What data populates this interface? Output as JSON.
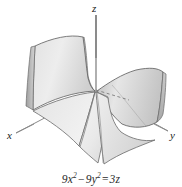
{
  "figure": {
    "caption": {
      "full_text": "9x² − 9y² = 3z",
      "term1_coeff": "9",
      "term1_var": "x",
      "term1_exp": "2",
      "operator_minus": "−",
      "term2_coeff": "9",
      "term2_var": "y",
      "term2_exp": "2",
      "operator_equals": "=",
      "rhs_coeff": "3",
      "rhs_var": "z"
    },
    "axes": {
      "x_label": "x",
      "y_label": "y",
      "z_label": "z"
    },
    "surface": {
      "name": "hyperbolic-paraboloid",
      "fill_light": "#f2f2f2",
      "fill_mid": "#dcdcdc",
      "fill_dark": "#b9b9b9",
      "outline_color": "#5a5a5a",
      "hidden_line_style": "dashed",
      "background": "#ffffff"
    }
  }
}
